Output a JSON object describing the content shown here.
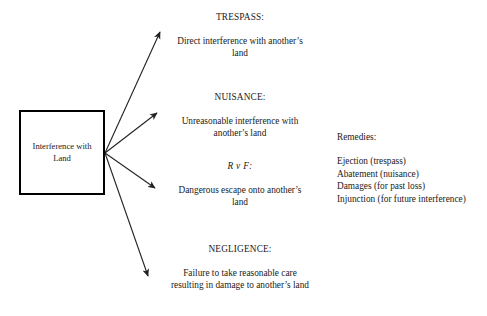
{
  "diagram": {
    "background_color": "#ffffff",
    "line_color": "#222222",
    "box_border_color": "#000000",
    "source": {
      "label": "Interference with\nLand"
    },
    "branches": [
      {
        "id": "trespass",
        "heading": "TRESPASS:",
        "body": "Direct interference with another’s\nland",
        "heading_italic": false
      },
      {
        "id": "nuisance",
        "heading": "NUISANCE:",
        "body": "Unreasonable interference with\nanother’s land",
        "heading_italic": false
      },
      {
        "id": "rvf",
        "heading": "R v F:",
        "body": "Dangerous escape onto another’s\nland",
        "heading_italic": true
      },
      {
        "id": "negligence",
        "heading": "NEGLIGENCE:",
        "body": "Failure to take reasonable care\nresulting in damage to another’s land",
        "heading_italic": false
      }
    ],
    "remedies": {
      "title": "Remedies:",
      "items": [
        "Ejection (trespass)",
        "Abatement (nuisance)",
        "Damages (for past loss)",
        "Injunction (for future interference)"
      ]
    },
    "connectors": [
      {
        "name": "arrow-to-trespass",
        "from": [
          105,
          153
        ],
        "to": [
          160,
          32
        ]
      },
      {
        "name": "arrow-to-nuisance",
        "from": [
          105,
          153
        ],
        "to": [
          157,
          113
        ]
      },
      {
        "name": "arrow-to-rvf",
        "from": [
          105,
          153
        ],
        "to": [
          155,
          188
        ]
      },
      {
        "name": "arrow-to-negligence",
        "from": [
          105,
          153
        ],
        "to": [
          148,
          276
        ]
      }
    ]
  }
}
